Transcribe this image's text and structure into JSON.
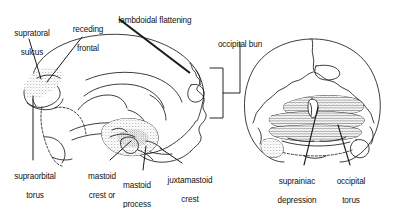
{
  "figure": {
    "background_color": "#ffffff",
    "ink_color": "#1a1a1a",
    "views": [
      {
        "name": "lateral-view",
        "description": "lateral (side) view of Neanderthal cranium"
      },
      {
        "name": "posterior-view",
        "description": "posterior (rear) view of Neanderthal cranium"
      }
    ]
  },
  "labels": {
    "supratoral_sulcus": {
      "line1": "supratoral",
      "line2": "sulcus"
    },
    "receding_frontal": {
      "line1": "receding",
      "line2": "frontal"
    },
    "lambdoidal_flattening": {
      "line1": "lambdoidal flattening"
    },
    "occipital_bun": {
      "line1": "occipital bun"
    },
    "supraorbital_torus": {
      "line1": "supraorbital",
      "line2": "torus"
    },
    "mastoid_crest_or_tuberosity": {
      "line1": "mastoid",
      "line2": "crest or",
      "line3": "tuberosity"
    },
    "mastoid_process": {
      "line1": "mastoid",
      "line2": "process"
    },
    "juxtamastoid_crest": {
      "line1": "juxtamastoid",
      "line2": "crest"
    },
    "suprainiac_depression": {
      "line1": "suprainiac",
      "line2": "depression"
    },
    "occipital_torus": {
      "line1": "occipital",
      "line2": "torus"
    }
  }
}
